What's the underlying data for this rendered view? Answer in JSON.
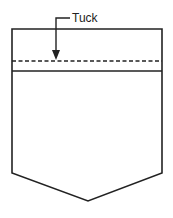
{
  "diagram": {
    "labels": {
      "tuck": "Tuck"
    },
    "colors": {
      "stroke": "#222222",
      "background": "#ffffff"
    }
  }
}
